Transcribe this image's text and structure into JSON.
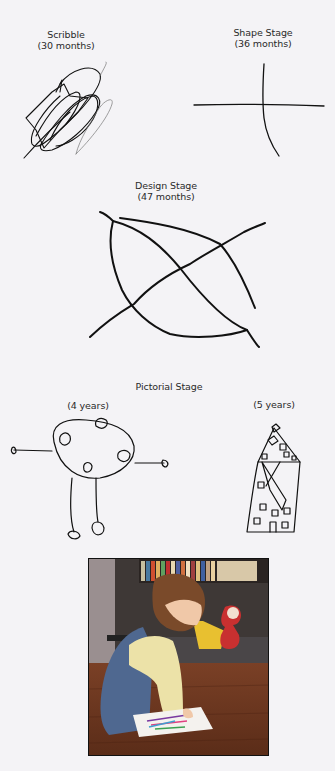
{
  "figure": {
    "stages": [
      {
        "name": "Scribble",
        "age": "(30 months)"
      },
      {
        "name": "Shape Stage",
        "age": "(36 months)"
      },
      {
        "name": "Design Stage",
        "age": "(47 months)"
      },
      {
        "name": "Pictorial Stage",
        "examples": [
          {
            "age": "(4 years)",
            "drawing": "person"
          },
          {
            "age": "(5 years)",
            "drawing": "house"
          }
        ]
      }
    ],
    "photo": {
      "subject": "toddler drawing with crayons on paper on a wooden floor"
    }
  },
  "colors": {
    "background": "#f4f3f6",
    "ink": "#111111"
  }
}
